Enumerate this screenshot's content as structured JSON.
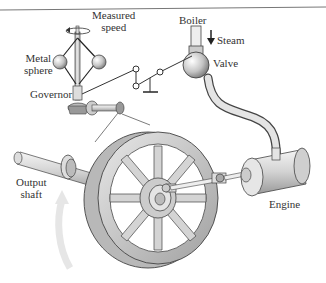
{
  "diagram": {
    "labels": {
      "measured_speed": [
        "Measured",
        "speed"
      ],
      "metal_sphere": [
        "Metal",
        "sphere"
      ],
      "governor": "Governor",
      "boiler": "Boiler",
      "steam": "Steam",
      "valve": "Valve",
      "output_shaft": [
        "Output",
        "shaft"
      ],
      "engine": "Engine"
    },
    "components": [
      {
        "id": "governor",
        "label": "Governor"
      },
      {
        "id": "metal-spheres",
        "label": "Metal sphere"
      },
      {
        "id": "linkage",
        "label": "Linkage"
      },
      {
        "id": "valve",
        "label": "Valve"
      },
      {
        "id": "boiler-pipe",
        "label": "Boiler"
      },
      {
        "id": "steam-pipe",
        "label": "Steam"
      },
      {
        "id": "engine",
        "label": "Engine"
      },
      {
        "id": "flywheel",
        "label": "Flywheel"
      },
      {
        "id": "output-shaft",
        "label": "Output shaft"
      }
    ],
    "arrows": [
      {
        "id": "steam-arrow",
        "direction": "down"
      },
      {
        "id": "rotation-arrow",
        "direction": "counterclockwise"
      },
      {
        "id": "measured-speed-arrow",
        "direction": "rotation"
      }
    ],
    "colors": {
      "metal_light": "#f0f0f0",
      "metal_mid": "#c8c8c8",
      "metal_dark": "#8a8a8a",
      "outline": "#3a3a3a",
      "rotation_arrow": "#e6e6e6",
      "top_rule": "#777777"
    }
  }
}
